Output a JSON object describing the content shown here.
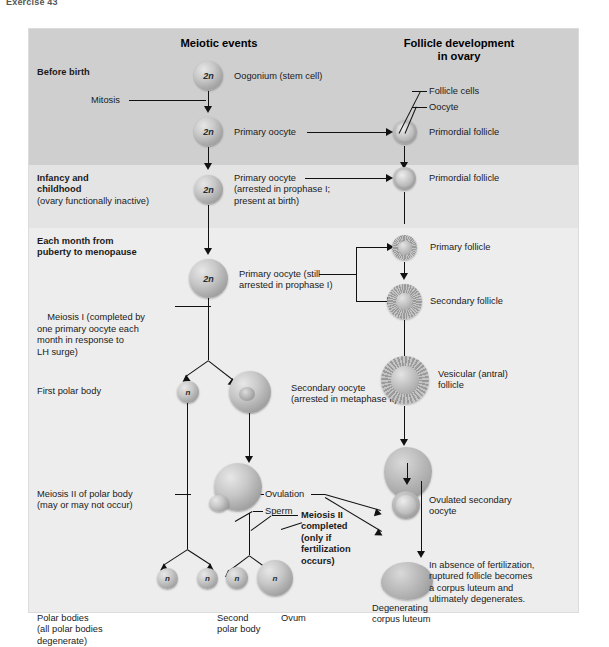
{
  "page": {
    "caption": "Exercise 43"
  },
  "figure": {
    "column_headers": [
      {
        "id": "meiotic-events",
        "text": "Meiotic events"
      },
      {
        "id": "follicle-development",
        "text": "Follicle development\nin ovary"
      }
    ],
    "stages": [
      {
        "id": "before-birth",
        "title": "Before birth",
        "subtitle": ""
      },
      {
        "id": "infancy-childhood",
        "title": "Infancy and\nchildhood",
        "subtitle": "(ovary functionally inactive)"
      },
      {
        "id": "puberty-menopause",
        "title": "Each month from\npuberty to menopause",
        "subtitle": ""
      }
    ],
    "meiotic_labels": [
      {
        "id": "mitosis",
        "text": "Mitosis"
      },
      {
        "id": "oogonium",
        "text": "Oogonium (stem cell)"
      },
      {
        "id": "primary-oocyte-1",
        "text": "Primary oocyte"
      },
      {
        "id": "primary-oocyte-2",
        "text": "Primary oocyte\n(arrested in prophase I;\npresent at birth)"
      },
      {
        "id": "primary-oocyte-3",
        "text": "Primary oocyte (still\narrested in prophase I)"
      },
      {
        "id": "meiosis-i",
        "bold_lead": "Meiosis I",
        "text": " (completed by\none primary oocyte each\nmonth in response to\nLH surge)"
      },
      {
        "id": "first-polar-body",
        "text": "First polar body"
      },
      {
        "id": "secondary-oocyte",
        "text": "Secondary oocyte\n(arrested in metaphase II)"
      },
      {
        "id": "meiosis-ii-polar-body",
        "text": "Meiosis II of polar body\n(may or may not occur)"
      },
      {
        "id": "ovulation",
        "text": "Ovulation"
      },
      {
        "id": "sperm",
        "text": "Sperm"
      },
      {
        "id": "meiosis-ii-completed",
        "text": "Meiosis II\ncompleted\n(only if\nfertilization\noccurs)"
      },
      {
        "id": "polar-bodies",
        "text": "Polar bodies\n(all polar bodies\ndegenerate)"
      },
      {
        "id": "second-polar-body",
        "text": "Second\npolar body"
      },
      {
        "id": "ovum",
        "text": "Ovum"
      }
    ],
    "follicle_labels": [
      {
        "id": "follicle-cells",
        "text": "Follicle cells"
      },
      {
        "id": "oocyte",
        "text": "Oocyte"
      },
      {
        "id": "primordial-follicle-1",
        "text": "Primordial follicle"
      },
      {
        "id": "primordial-follicle-2",
        "text": "Primordial follicle"
      },
      {
        "id": "primary-follicle",
        "text": "Primary follicle"
      },
      {
        "id": "secondary-follicle",
        "text": "Secondary follicle"
      },
      {
        "id": "vesicular-follicle",
        "text": "Vesicular (antral)\nfollicle"
      },
      {
        "id": "ovulated-secondary-oocyte",
        "text": "Ovulated secondary\noocyte"
      },
      {
        "id": "corpus-luteum-note",
        "text": "In absence of fertilization,\nruptured follicle becomes\na corpus luteum and\nultimately degenerates."
      },
      {
        "id": "degenerating-corpus-luteum",
        "text": "Degenerating\ncorpus luteum"
      }
    ],
    "ploidy": {
      "diploid": "2n",
      "haploid": "n"
    },
    "cells": [
      {
        "id": "oogonium-cell",
        "ploidy": "2n"
      },
      {
        "id": "primary-oocyte-cell-1",
        "ploidy": "2n"
      },
      {
        "id": "primary-oocyte-cell-2",
        "ploidy": "2n"
      },
      {
        "id": "primary-oocyte-cell-3",
        "ploidy": "2n"
      },
      {
        "id": "first-polar-body-cell",
        "ploidy": "n"
      },
      {
        "id": "polar-body-a",
        "ploidy": "n"
      },
      {
        "id": "polar-body-b",
        "ploidy": "n"
      },
      {
        "id": "second-polar-body-cell",
        "ploidy": "n"
      },
      {
        "id": "ovum-cell",
        "ploidy": "n"
      }
    ],
    "colors": {
      "band_dark": "#cfcfcf",
      "band_light": "#e4e4e4",
      "band_pale": "#ededed",
      "line": "#111111",
      "text": "#1a1a1a"
    }
  }
}
